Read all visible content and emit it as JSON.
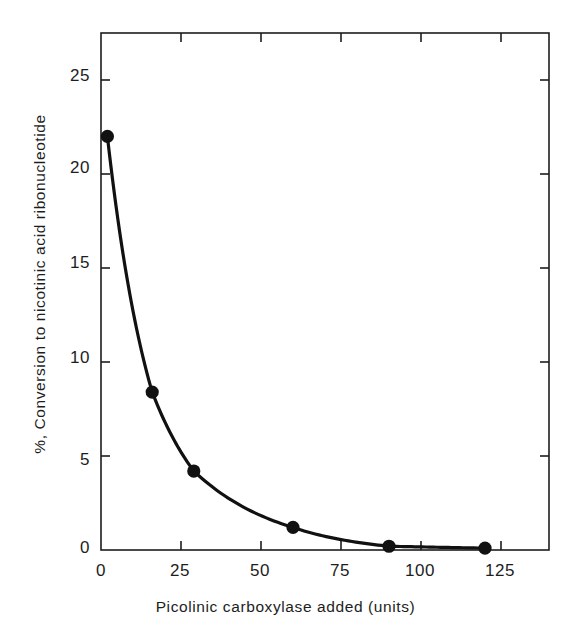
{
  "chart_data": {
    "type": "line",
    "title": "",
    "subtitle": "",
    "xlabel": "Picolinic carboxylase added (units)",
    "ylabel": "%, Conversion to nicotinic acid ribonucleotide",
    "xlim": [
      0,
      140
    ],
    "ylim": [
      0,
      27.5
    ],
    "xticks": [
      0,
      25,
      50,
      75,
      100,
      125
    ],
    "xtick_labels": [
      "0",
      "25",
      "50",
      "75",
      "100",
      "125"
    ],
    "yticks": [
      0,
      5,
      10,
      15,
      20,
      25
    ],
    "ytick_labels": [
      "0",
      "5",
      "10",
      "15",
      "20",
      "25"
    ],
    "grid": false,
    "legend": null,
    "legend_position": "none",
    "frame": "box",
    "tick_direction": "in",
    "series": [
      {
        "name": "Conversion to nicotinic acid ribonucleotide",
        "marker": "filled-circle",
        "marker_color": "#111111",
        "line_color": "#111111",
        "line_width": 3.2,
        "x": [
          2,
          16,
          29,
          60,
          90,
          120
        ],
        "y": [
          22.0,
          8.4,
          4.2,
          1.2,
          0.2,
          0.1
        ]
      }
    ],
    "annotations": []
  },
  "figure": {
    "background_color": "#ffffff",
    "axis_color": "#1d1d1d",
    "data_color": "#111111"
  }
}
